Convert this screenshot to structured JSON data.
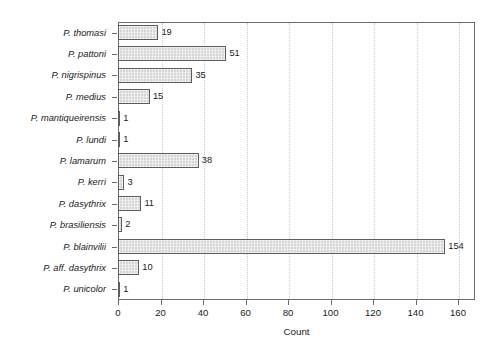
{
  "chart_data": {
    "type": "bar",
    "orientation": "horizontal",
    "title": "",
    "xlabel": "Count",
    "ylabel": "",
    "xlim": [
      0,
      168
    ],
    "xticks": [
      0,
      20,
      40,
      60,
      80,
      100,
      120,
      140,
      160
    ],
    "grid": "vertical-dotted",
    "legend": "none",
    "bar_color": "#d6d6d6",
    "bar_edge_color": "#5d5d5d",
    "axis_color": "#6b6b6b",
    "categories": [
      "P. thomasi",
      "P. pattoni",
      "P. nigrispinus",
      "P. medius",
      "P. mantiqueirensis",
      "P. lundi",
      "P. lamarum",
      "P. kerri",
      "P. dasythrix",
      "P. brasiliensis",
      "P. blainvilii",
      "P. aff. dasythrix",
      "P. unicolor"
    ],
    "values": [
      19,
      51,
      35,
      15,
      1,
      1,
      38,
      3,
      11,
      2,
      154,
      10,
      1
    ],
    "value_labels": [
      "19",
      "51",
      "35",
      "15",
      "1",
      "1",
      "38",
      "3",
      "11",
      "2",
      "154",
      "10",
      "1"
    ]
  }
}
